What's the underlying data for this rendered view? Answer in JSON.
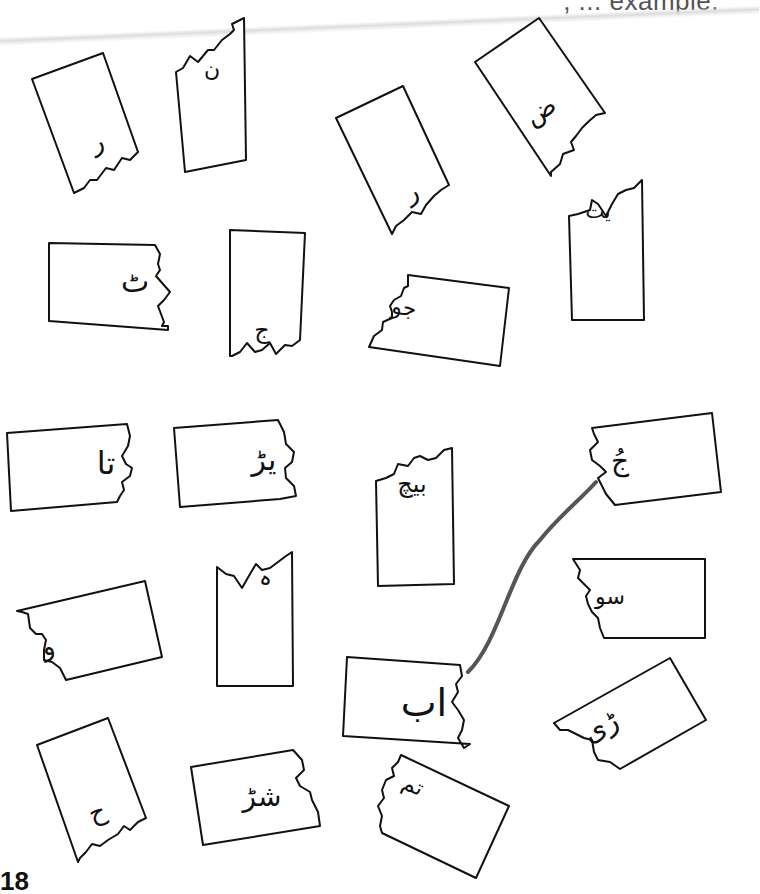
{
  "page": {
    "header_fragment": ", ... example.",
    "page_number": "18"
  },
  "cards": [
    {
      "id": "c1",
      "letter": "ر",
      "position": "top-left, tilted",
      "torn_edge": "bottom"
    },
    {
      "id": "c2",
      "letter": "ن",
      "position": "top, second column",
      "torn_edge": "top"
    },
    {
      "id": "c3",
      "letter": "ر",
      "position": "top center, tilted",
      "torn_edge": "bottom"
    },
    {
      "id": "c4",
      "letter": "ض",
      "position": "top-right, tilted",
      "torn_edge": "bottom"
    },
    {
      "id": "c5",
      "letter": "ٹ",
      "position": "row 2, left",
      "torn_edge": "right"
    },
    {
      "id": "c6",
      "letter": "ج",
      "position": "row 2, second column",
      "torn_edge": "bottom"
    },
    {
      "id": "c7",
      "letter": "جو",
      "position": "row 2, center",
      "torn_edge": "left"
    },
    {
      "id": "c8",
      "letter": "یت",
      "position": "row 2, right",
      "torn_edge": "top"
    },
    {
      "id": "c9",
      "letter": "تا",
      "position": "row 3, left",
      "torn_edge": "right"
    },
    {
      "id": "c10",
      "letter": "یڑ",
      "position": "row 3, second column",
      "torn_edge": "right"
    },
    {
      "id": "c11",
      "letter": "بیچ",
      "position": "row 3, center",
      "torn_edge": "top"
    },
    {
      "id": "c12",
      "letter": "جُ",
      "position": "row 3, right",
      "torn_edge": "left"
    },
    {
      "id": "c13",
      "letter": "و",
      "position": "row 4, left, tilted",
      "torn_edge": "left"
    },
    {
      "id": "c14",
      "letter": "ہ",
      "position": "row 4, second column",
      "torn_edge": "top"
    },
    {
      "id": "c15",
      "letter": "سو",
      "position": "row 4, right",
      "torn_edge": "left"
    },
    {
      "id": "c16",
      "letter": "اب",
      "position": "row 5, center",
      "torn_edge": "right"
    },
    {
      "id": "c17",
      "letter": "ڑی",
      "position": "row 5, right, tilted",
      "torn_edge": "left"
    },
    {
      "id": "c18",
      "letter": "ح",
      "position": "bottom-left, tilted",
      "torn_edge": "bottom"
    },
    {
      "id": "c19",
      "letter": "شڑ",
      "position": "bottom, second column",
      "torn_edge": "right"
    },
    {
      "id": "c20",
      "letter": "تم",
      "position": "bottom center, tilted",
      "torn_edge": "left"
    }
  ],
  "matches": [
    {
      "from": "c16",
      "to": "c12",
      "label": "example match line",
      "color": "#555555"
    }
  ]
}
